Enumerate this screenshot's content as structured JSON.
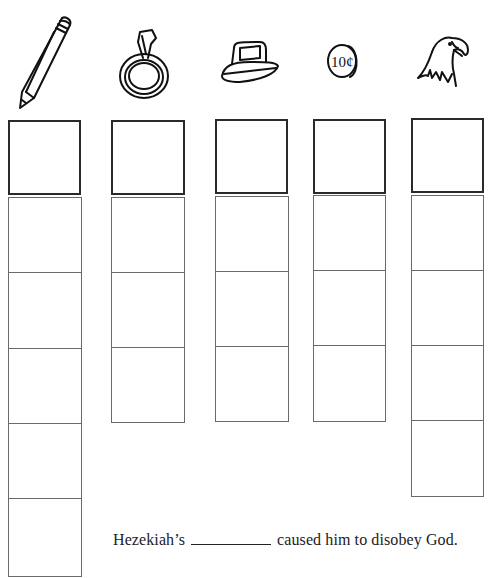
{
  "worksheet": {
    "columns": [
      {
        "id": "pencil",
        "icon": "pencil-icon",
        "top_boxes": 1,
        "lower_cells": 5
      },
      {
        "id": "ring",
        "icon": "ring-icon",
        "top_boxes": 1,
        "lower_cells": 3
      },
      {
        "id": "iron",
        "icon": "iron-icon",
        "top_boxes": 1,
        "lower_cells": 3
      },
      {
        "id": "dime",
        "icon": "dime-coin-icon",
        "top_boxes": 1,
        "lower_cells": 3,
        "coin_label": "10¢"
      },
      {
        "id": "eagle",
        "icon": "eagle-head-icon",
        "top_boxes": 1,
        "lower_cells": 4
      }
    ],
    "sentence": {
      "before": "Hezekiah’s",
      "blank": "",
      "after": "caused him to disobey God."
    }
  }
}
